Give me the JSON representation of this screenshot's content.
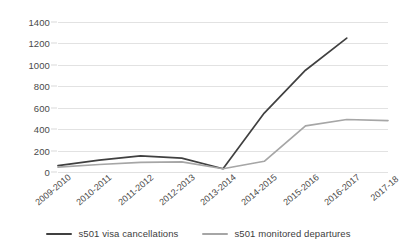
{
  "chart_data": {
    "type": "line",
    "title": "",
    "subtitle": "",
    "xlabel": "",
    "ylabel": "",
    "categories": [
      "2009-2010",
      "2010-2011",
      "2011-2012",
      "2012-2013",
      "2013-2014",
      "2014-2015",
      "2015-2016",
      "2016-2017",
      "2017-18"
    ],
    "series": [
      {
        "name": "s501 visa cancellations",
        "color": "#404040",
        "values": [
          60,
          110,
          150,
          130,
          30,
          550,
          950,
          1250,
          null
        ]
      },
      {
        "name": "s501 monitored departures",
        "color": "#a6a6a6",
        "values": [
          45,
          70,
          90,
          95,
          30,
          100,
          430,
          490,
          480
        ]
      }
    ],
    "ylim": [
      0,
      1400
    ],
    "ytick_values": [
      0,
      200,
      400,
      600,
      800,
      1000,
      1200,
      1400
    ],
    "ytick_labels": [
      "0",
      "200",
      "400",
      "600",
      "800",
      "1000",
      "1200",
      "1400"
    ],
    "grid": true,
    "legend_position": "bottom",
    "gridline_color": "#e2e2e2",
    "axis_text_color": "#4a4a4a"
  },
  "legend": {
    "items": [
      {
        "label": "s501 visa cancellations",
        "color": "#404040"
      },
      {
        "label": "s501 monitored departures",
        "color": "#a6a6a6"
      }
    ]
  }
}
